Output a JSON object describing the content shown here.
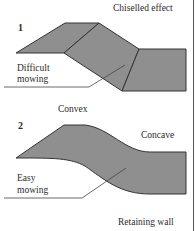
{
  "figure": {
    "fill_color": "#8f8f8f",
    "stroke_color": "#333333",
    "panels": [
      {
        "number": "1",
        "title": "Chiselled effect",
        "annotation": [
          "Difficult",
          "mowing"
        ],
        "footer": "Convex"
      },
      {
        "number": "2",
        "title": "Concave",
        "annotation": [
          "Easy",
          "mowing"
        ],
        "footer": "Retaining wall"
      }
    ]
  }
}
